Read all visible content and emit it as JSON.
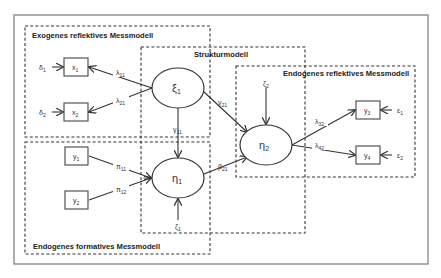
{
  "diagram": {
    "blocks": {
      "exogenous_reflective": {
        "title": "Exogenes reflektives Messmodell"
      },
      "structural": {
        "title": "Strukturmodell"
      },
      "endogenous_reflective": {
        "title": "Endogenes reflektives Messmodell"
      },
      "endogenous_formative": {
        "title": "Endogenes formatives Messmodell"
      }
    },
    "latent": {
      "xi1": {
        "symbol": "ξ",
        "sub": "1"
      },
      "eta1": {
        "symbol": "η",
        "sub": "1"
      },
      "eta2": {
        "symbol": "η",
        "sub": "2"
      }
    },
    "indicators": {
      "x1": {
        "symbol": "x",
        "sub": "1"
      },
      "x2": {
        "symbol": "x",
        "sub": "2"
      },
      "y1": {
        "symbol": "y",
        "sub": "1"
      },
      "y2": {
        "symbol": "y",
        "sub": "2"
      },
      "y3": {
        "symbol": "y",
        "sub": "3"
      },
      "y4": {
        "symbol": "y",
        "sub": "4"
      }
    },
    "errors": {
      "delta1": {
        "symbol": "δ",
        "sub": "1"
      },
      "delta2": {
        "symbol": "δ",
        "sub": "2"
      },
      "eps1": {
        "symbol": "ε",
        "sub": "1"
      },
      "eps2": {
        "symbol": "ε",
        "sub": "2"
      },
      "zeta1": {
        "symbol": "ζ",
        "sub": "1"
      },
      "zeta2": {
        "symbol": "ζ",
        "sub": "2"
      }
    },
    "paths": {
      "lambda11": {
        "symbol": "λ",
        "sub": "11"
      },
      "lambda21": {
        "symbol": "λ",
        "sub": "21"
      },
      "lambda32": {
        "symbol": "λ",
        "sub": "32"
      },
      "lambda42": {
        "symbol": "λ",
        "sub": "42"
      },
      "pi11": {
        "symbol": "π",
        "sub": "11"
      },
      "pi12": {
        "symbol": "π",
        "sub": "12"
      },
      "gamma11": {
        "symbol": "γ",
        "sub": "11"
      },
      "gamma21": {
        "symbol": "γ",
        "sub": "21"
      },
      "beta21": {
        "symbol": "β",
        "sub": "21"
      }
    }
  }
}
